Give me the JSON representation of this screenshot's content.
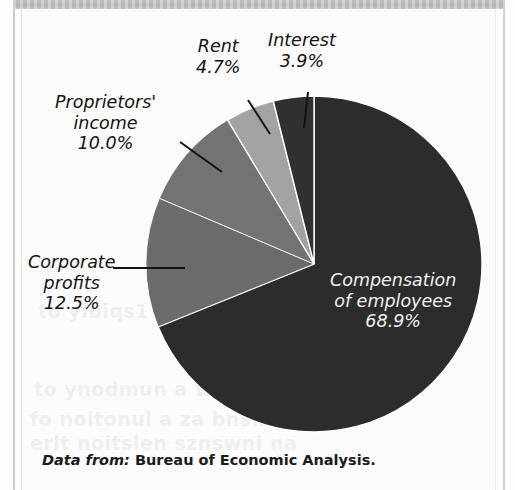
{
  "figure": {
    "caption_lead": "Data from:",
    "caption_source": "Bureau of Economic Analysis.",
    "background_color": "#fdfdfd"
  },
  "bleed_through": [
    {
      "text": "to ylbiqs1",
      "x": 38,
      "y": 300
    },
    {
      "text": "to ynodmun a worlz a",
      "x": 34,
      "y": 378
    },
    {
      "text": "fo noitonul a za bnsmeb",
      "x": 30,
      "y": 408
    },
    {
      "text": "erlt noitslen sznswni na",
      "x": 30,
      "y": 432
    }
  ],
  "chart_data": {
    "type": "pie",
    "title": "",
    "xlabel": "",
    "ylabel": "",
    "units": "percent",
    "legend_position": "none",
    "label_style": "callout",
    "start_angle_deg": 0,
    "direction": "clockwise",
    "categories": [
      "Compensation of employees",
      "Corporate profits",
      "Proprietors' income",
      "Rent",
      "Interest"
    ],
    "values": [
      68.9,
      12.5,
      10.0,
      4.7,
      3.9
    ],
    "slices": [
      {
        "name": "Compensation of employees",
        "label_line1": "Compensation",
        "label_line2": "of employees",
        "value_label": "68.9%",
        "value": 68.9,
        "angle_deg": 248.04,
        "color": "#2b2b2b",
        "label_placement": "inside",
        "label_x": 330,
        "label_y": 270,
        "leader": false
      },
      {
        "name": "Corporate profits",
        "label_line1": "Corporate",
        "label_line2": "profits",
        "value_label": "12.5%",
        "value": 12.5,
        "angle_deg": 45.0,
        "color": "#6b6b6b",
        "label_placement": "outside",
        "label_x": 28,
        "label_y": 252,
        "leader": true
      },
      {
        "name": "Proprietors' income",
        "label_line1": "Proprietors'",
        "label_line2": "income",
        "value_label": "10.0%",
        "value": 10.0,
        "angle_deg": 36.0,
        "color": "#737373",
        "label_placement": "outside",
        "label_x": 55,
        "label_y": 92,
        "leader": true
      },
      {
        "name": "Rent",
        "label_line1": "Rent",
        "label_line2": "",
        "value_label": "4.7%",
        "value": 4.7,
        "angle_deg": 16.92,
        "color": "#a3a3a3",
        "label_placement": "outside",
        "label_x": 196,
        "label_y": 36,
        "leader": true
      },
      {
        "name": "Interest",
        "label_line1": "Interest",
        "label_line2": "",
        "value_label": "3.9%",
        "value": 3.9,
        "angle_deg": 14.04,
        "color": "#303030",
        "label_placement": "outside",
        "label_x": 268,
        "label_y": 30,
        "leader": true
      }
    ],
    "geometry": {
      "cx": 314,
      "cy": 264,
      "r": 168
    }
  }
}
